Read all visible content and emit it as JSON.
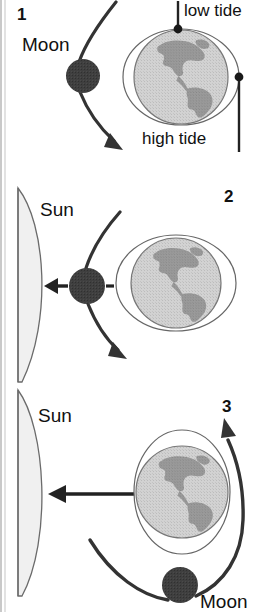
{
  "figure": {
    "background_color": "#ffffff",
    "ink_color": "#2f2f2f",
    "moon_color": "#3d3d3d",
    "ocean_color": "#c9c9c9",
    "land_color": "#8e8e8e",
    "sun_color": "#efefef",
    "outline_color": "#555555"
  },
  "panels": [
    {
      "number": "1",
      "labels": {
        "moon": "Moon",
        "low_tide": "low tide",
        "high_tide": "high tide"
      },
      "bodies": {
        "moon_name": "moon-disc",
        "earth_name": "earth-globe",
        "bulge_name": "tidal-bulge-ellipse"
      },
      "bulge_orientation": "horizontal",
      "markers": [
        "low-tide-marker",
        "high-tide-marker"
      ]
    },
    {
      "number": "2",
      "labels": {
        "sun": "Sun"
      },
      "bodies": {
        "sun_name": "sun-limb",
        "moon_name": "moon-disc",
        "earth_name": "earth-globe",
        "bulge_name": "tidal-bulge-ellipse"
      },
      "bulge_orientation": "horizontal",
      "arrows": [
        "moon-orbit-arrow",
        "gravity-arrow-to-sun",
        "tidal-dash"
      ]
    },
    {
      "number": "3",
      "labels": {
        "sun": "Sun",
        "moon": "Moon"
      },
      "bodies": {
        "sun_name": "sun-limb",
        "moon_name": "moon-disc",
        "earth_name": "earth-globe",
        "bulge_name": "tidal-bulge-ellipse"
      },
      "bulge_orientation": "vertical",
      "arrows": [
        "gravity-arrow-to-sun",
        "moon-orbit-arrow"
      ]
    }
  ]
}
